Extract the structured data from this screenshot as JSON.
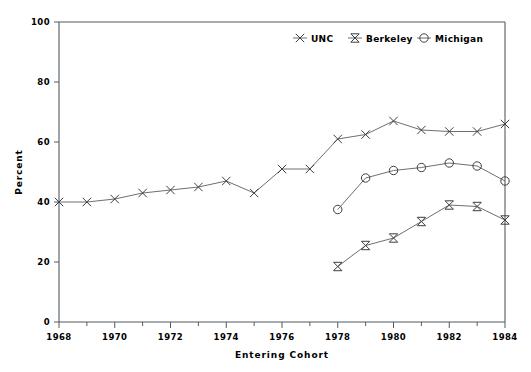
{
  "chart_data": {
    "type": "line",
    "title": "",
    "xlabel": "Entering Cohort",
    "ylabel": "Percent",
    "xlim": [
      1968,
      1984
    ],
    "ylim": [
      0,
      100
    ],
    "grid": false,
    "legend_position": "top-center",
    "x_ticks": [
      1968,
      1970,
      1972,
      1974,
      1976,
      1978,
      1980,
      1982,
      1984
    ],
    "x_tick_labels": [
      "1968",
      "1970",
      "1972",
      "1974",
      "1976",
      "1978",
      "1980",
      "1982",
      "1984"
    ],
    "x_minor_ticks": [
      1969,
      1971,
      1973,
      1975,
      1977,
      1979,
      1981,
      1983
    ],
    "y_ticks": [
      0,
      20,
      40,
      60,
      80,
      100
    ],
    "y_tick_labels": [
      "0",
      "20",
      "40",
      "60",
      "80",
      "100"
    ],
    "series": [
      {
        "name": "UNC",
        "marker": "x-cross",
        "x": [
          1968,
          1969,
          1970,
          1971,
          1972,
          1973,
          1974,
          1975,
          1976,
          1977,
          1978,
          1979,
          1980,
          1981,
          1982,
          1983,
          1984
        ],
        "values": [
          40,
          40,
          41,
          43,
          44,
          45,
          47,
          43,
          51,
          51,
          61,
          62.5,
          67,
          64,
          63.5,
          63.5,
          66
        ]
      },
      {
        "name": "Berkeley",
        "marker": "bowtie",
        "x": [
          1978,
          1979,
          1980,
          1981,
          1982,
          1983,
          1984
        ],
        "values": [
          18.5,
          25.5,
          28,
          33.5,
          39,
          38.5,
          34
        ]
      },
      {
        "name": "Michigan",
        "marker": "circle",
        "x": [
          1978,
          1979,
          1980,
          1981,
          1982,
          1983,
          1984
        ],
        "values": [
          37.5,
          48,
          50.5,
          51.5,
          53,
          52,
          47
        ]
      }
    ]
  },
  "legend": {
    "entries": [
      {
        "label": "UNC",
        "marker": "x-cross"
      },
      {
        "label": "Berkeley",
        "marker": "bowtie"
      },
      {
        "label": "Michigan",
        "marker": "circle"
      }
    ]
  },
  "colors": {
    "line": "#6a7074",
    "marker": "#3b3f42",
    "axis": "#555b5e",
    "text": "#000000",
    "background": "#ffffff"
  }
}
